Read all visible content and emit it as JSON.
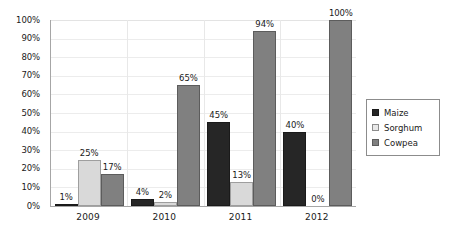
{
  "chart_data": {
    "type": "bar",
    "title": "",
    "subtitle": "",
    "xlabel": "",
    "ylabel": "",
    "categories": [
      "2009",
      "2010",
      "2011",
      "2012"
    ],
    "series": [
      {
        "name": "Maize",
        "color": "#262626",
        "values": [
          1,
          4,
          45,
          40
        ],
        "labels": [
          "1%",
          "4%",
          "45%",
          "40%"
        ]
      },
      {
        "name": "Sorghum",
        "color": "#d9d9d9",
        "values": [
          25,
          2,
          13,
          0
        ],
        "labels": [
          "25%",
          "2%",
          "13%",
          "0%"
        ]
      },
      {
        "name": "Cowpea",
        "color": "#808080",
        "values": [
          17,
          65,
          94,
          100
        ],
        "labels": [
          "17%",
          "65%",
          "94%",
          "100%"
        ]
      }
    ],
    "ylim": [
      0,
      100
    ],
    "y_ticks": [
      0,
      10,
      20,
      30,
      40,
      50,
      60,
      70,
      80,
      90,
      100
    ],
    "y_tick_labels": [
      "0%",
      "10%",
      "20%",
      "30%",
      "40%",
      "50%",
      "60%",
      "70%",
      "80%",
      "90%",
      "100%"
    ],
    "grid": true,
    "legend_position": "right",
    "legend_entries": [
      "Maize",
      "Sorghum",
      "Cowpea"
    ],
    "value_labels_shown": true
  }
}
